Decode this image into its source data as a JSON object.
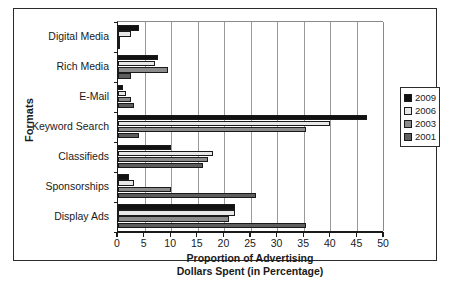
{
  "chart_data": {
    "type": "bar",
    "orientation": "horizontal",
    "title": "",
    "xlabel": "Proportion of Advertising Dollars Spent (in Percentage)",
    "xlabel_line1": "Proportion of Advertising",
    "xlabel_line2": "Dollars Spent (in Percentage)",
    "ylabel": "Formats",
    "xlim": [
      0,
      50
    ],
    "xticks": [
      0,
      5,
      10,
      15,
      20,
      25,
      30,
      35,
      40,
      45,
      50
    ],
    "xtick_labels": [
      "0",
      "5",
      "10",
      "15",
      "20",
      "25",
      "30",
      "35",
      "40",
      "45",
      "50"
    ],
    "grid": true,
    "grid_axis": "x",
    "legend_position": "right",
    "categories": [
      "Digital Media",
      "Rich Media",
      "E-Mail",
      "Keyword Search",
      "Classifieds",
      "Sponsorships",
      "Display Ads"
    ],
    "series": [
      {
        "name": "2009",
        "color": "#111111",
        "values": [
          4,
          7.5,
          1,
          47,
          10,
          2,
          22
        ]
      },
      {
        "name": "2006",
        "color": "#e8e8e8",
        "values": [
          2.5,
          7,
          1.5,
          40,
          18,
          3,
          22
        ]
      },
      {
        "name": "2003",
        "color": "#8c8c8c",
        "values": [
          0.2,
          9.5,
          2.5,
          35.5,
          17,
          10,
          21
        ]
      },
      {
        "name": "2001",
        "color": "#5e5e5e",
        "values": [
          0.2,
          2.5,
          3,
          4,
          16,
          26,
          35.5
        ]
      }
    ]
  },
  "legend": {
    "items": [
      {
        "label": "2009",
        "color": "#111111"
      },
      {
        "label": "2006",
        "color": "#e8e8e8"
      },
      {
        "label": "2003",
        "color": "#8c8c8c"
      },
      {
        "label": "2001",
        "color": "#5e5e5e"
      }
    ]
  }
}
